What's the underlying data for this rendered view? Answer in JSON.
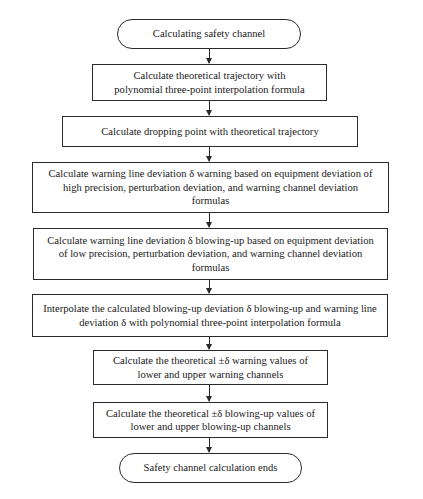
{
  "flowchart": {
    "start": "Calculating safety channel",
    "steps": [
      "Calculate theoretical trajectory with\npolynomial three-point interpolation formula",
      "Calculate dropping point with theoretical trajectory",
      "Calculate warning line deviation δ warning based on equipment deviation of high precision, perturbation deviation, and warning channel deviation formulas",
      "Calculate warning line deviation δ blowing-up based on equipment deviation of low precision, perturbation deviation, and warning channel deviation formulas",
      "Interpolate the calculated blowing-up deviation δ blowing-up and warning line deviation δ with polynomial three-point interpolation formula",
      "Calculate the theoretical ±δ warning values of lower and upper warning channels",
      "Calculate the theoretical ±δ blowing-up values of lower and upper blowing-up channels"
    ],
    "end": "Safety channel calculation ends",
    "colors": {
      "stroke": "#2a2a2a",
      "background": "#ffffff",
      "text": "#1a1a1a"
    }
  }
}
